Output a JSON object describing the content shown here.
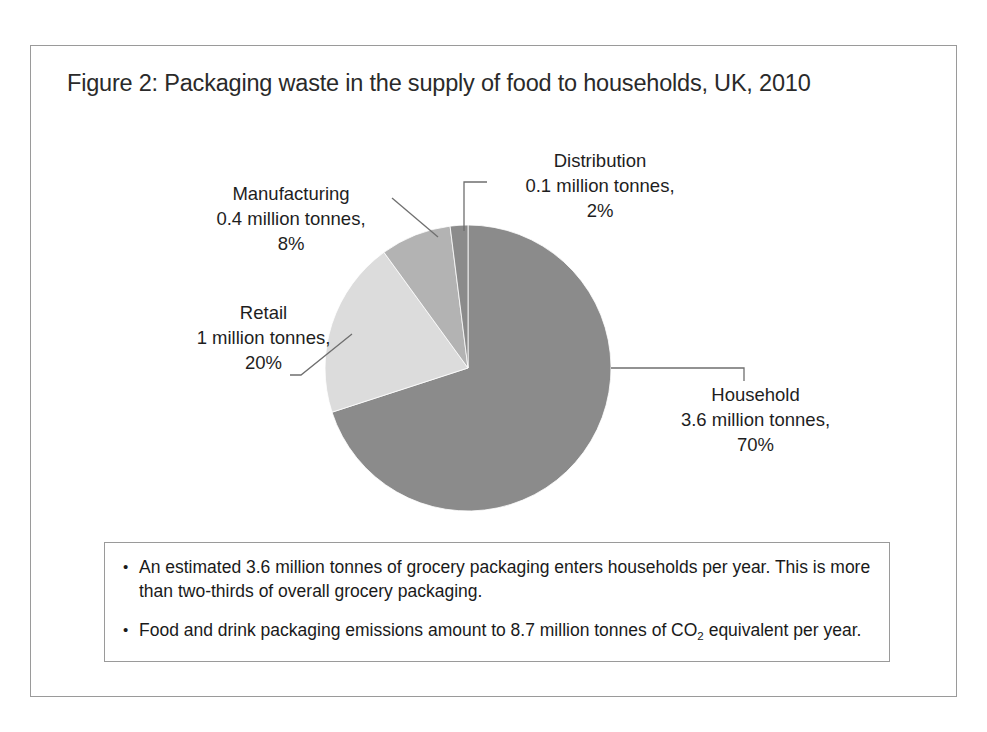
{
  "page": {
    "top_scan_text": "",
    "background_color": "#ffffff",
    "frame_border_color": "#9a9a9a"
  },
  "figure": {
    "title": "Figure 2: Packaging waste in the supply of food to households, UK, 2010"
  },
  "chart_data": {
    "type": "pie",
    "title": "Figure 2: Packaging waste in the supply of food to households, UK, 2010",
    "xlabel": "",
    "ylabel": "",
    "unit": "million tonnes",
    "total_value": 5.1,
    "legend_position": "none",
    "grid": false,
    "labels_outside": true,
    "start_angle_deg": 0,
    "direction": "clockwise",
    "categories": [
      "Household",
      "Retail",
      "Manufacturing",
      "Distribution"
    ],
    "values": [
      3.6,
      1,
      0.4,
      0.1
    ],
    "percentages": [
      70,
      20,
      8,
      2
    ],
    "colors": [
      "#8b8b8b",
      "#dcdcdc",
      "#b3b3b3",
      "#8b8b8b"
    ],
    "slices": [
      {
        "name": "Household",
        "value": 3.6,
        "value_text": "3.6 million tonnes,",
        "percent": 70,
        "percent_text": "70%",
        "color": "#8b8b8b"
      },
      {
        "name": "Retail",
        "value": 1,
        "value_text": "1 million tonnes,",
        "percent": 20,
        "percent_text": "20%",
        "color": "#dcdcdc"
      },
      {
        "name": "Manufacturing",
        "value": 0.4,
        "value_text": "0.4 million tonnes,",
        "percent": 8,
        "percent_text": "8%",
        "color": "#b3b3b3"
      },
      {
        "name": "Distribution",
        "value": 0.1,
        "value_text": "0.1 million tonnes,",
        "percent": 2,
        "percent_text": "2%",
        "color": "#8b8b8b"
      }
    ]
  },
  "callout": {
    "bullet_glyph": "•",
    "bullets": [
      {
        "text_before": "An estimated 3.6 million tonnes of grocery packaging enters households per year. This is more than two-thirds of overall grocery packaging.",
        "sub": "",
        "text_after": ""
      },
      {
        "text_before": "Food and drink packaging emissions amount to 8.7 million tonnes of CO",
        "sub": "2",
        "text_after": " equivalent per year."
      }
    ]
  }
}
